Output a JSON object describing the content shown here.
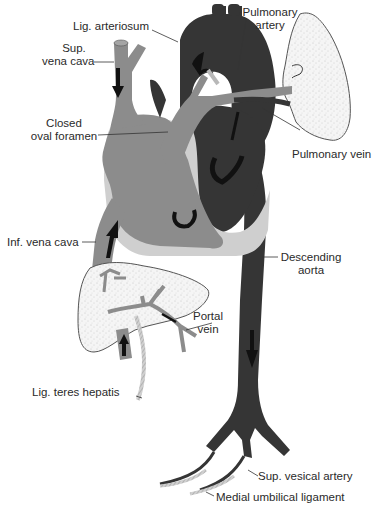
{
  "diagram": {
    "colors": {
      "arterial_dark": "#353535",
      "venous_mid": "#8c8c8c",
      "heart_wall_light": "#cfcfcf",
      "organ_fill": "#f4f4f4",
      "ligament": "#b8b8b8",
      "outline": "#4a4a4a",
      "arrow": "#111111"
    },
    "labels": {
      "lig_arteriosum": "Lig. arteriosum",
      "pulmonary_artery": {
        "line1": "Pulmonary",
        "line2": "artery"
      },
      "sup_vena_cava": {
        "line1": "Sup.",
        "line2": "vena cava"
      },
      "closed_oval_foramen": {
        "line1": "Closed",
        "line2": "oval foramen"
      },
      "pulmonary_vein": "Pulmonary vein",
      "inf_vena_cava": "Inf. vena cava",
      "descending_aorta": {
        "line1": "Descending",
        "line2": "aorta"
      },
      "portal_vein": {
        "line1": "Portal",
        "line2": "vein"
      },
      "lig_teres_hepatis": "Lig. teres hepatis",
      "sup_vesical_artery": "Sup. vesical artery",
      "medial_umbilical_ligament": "Medial umbilical ligament"
    },
    "structures": [
      "superior-vena-cava",
      "aortic-arch",
      "pulmonary-trunk",
      "ligamentum-arteriosum",
      "right-atrium",
      "right-ventricle",
      "left-ventricle",
      "lung",
      "inferior-vena-cava",
      "liver",
      "portal-vein",
      "ligamentum-teres",
      "descending-aorta",
      "iliac-bifurcation",
      "superior-vesical-arteries",
      "medial-umbilical-ligaments"
    ]
  }
}
